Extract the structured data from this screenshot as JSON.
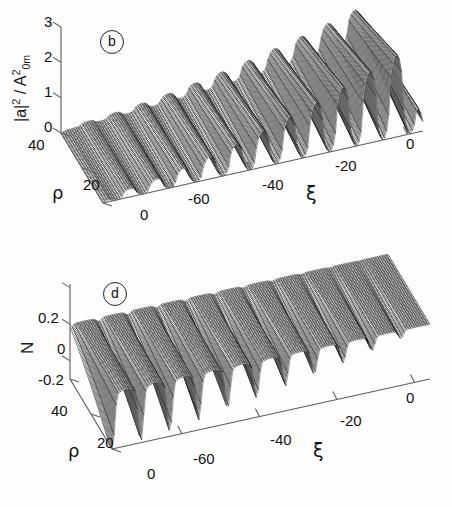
{
  "figure": {
    "background": "#fdfdfd",
    "ink": "#111111",
    "panels": [
      "b",
      "d"
    ]
  },
  "panel_b": {
    "badge": "b",
    "ylabel_main": "|a|",
    "ylabel_sup": "2",
    "ylabel_mid": " / A",
    "ylabel_sup2": "2",
    "ylabel_sub": "0m",
    "ylabel_plain": "|a|2 / A20m",
    "yticks": [
      "3",
      "2",
      "1",
      "0"
    ],
    "xi_label": "ξ",
    "xi_ticks": [
      "-60",
      "-40",
      "-20",
      "0"
    ],
    "rho_label": "ρ",
    "rho_ticks": [
      "40",
      "20",
      "0"
    ]
  },
  "panel_d": {
    "badge": "d",
    "ylabel_plain": "N",
    "yticks": [
      "0.2",
      "0",
      "-0.2"
    ],
    "xi_label": "ξ",
    "xi_ticks": [
      "-60",
      "-40",
      "-20",
      "0"
    ],
    "rho_label": "ρ",
    "rho_ticks": [
      "40",
      "20",
      "0"
    ]
  },
  "chart_data": [
    {
      "type": "surface3d",
      "panel": "b",
      "title": "(b)",
      "zlabel": "|a|^2 / A^2_0m",
      "xlabel": "ξ",
      "ylabel": "ρ",
      "zlim": [
        0,
        3
      ],
      "zticks": [
        0,
        1,
        2,
        3
      ],
      "xlim": [
        -75,
        5
      ],
      "xticks": [
        -60,
        -40,
        -20,
        0
      ],
      "ylim": [
        0,
        40
      ],
      "yticks": [
        0,
        20,
        40
      ],
      "grid": false,
      "legend": "none",
      "description": "Wireframe mesh surface of normalized intensity |a|^2/A^2_0m versus propagation coordinate xi and transverse coordinate rho. A train of roughly 12 periodic crests grows in amplitude from xi = -75 toward xi = 0, reaching peaks near 2.5. Between crests are deep narrow troughs that plunge to near zero at small rho, forming sharp spike-like cusps. Amplitude envelope increases monotonically with xi; modulation is strongest at low rho and smooth near rho = 40.",
      "z_surface_notes": {
        "mean_level": 1.0,
        "peak_max": 2.6,
        "trough_min": 0.0,
        "num_oscillation_periods": 12,
        "envelope_growth": "increasing with xi from -75 to 0"
      },
      "sampled_profile_at_rho0": {
        "xi": [
          -75,
          -70,
          -65,
          -60,
          -55,
          -50,
          -45,
          -40,
          -35,
          -30,
          -25,
          -20,
          -15,
          -10,
          -5,
          0
        ],
        "z": [
          0.25,
          0.4,
          0.15,
          0.9,
          0.05,
          1.2,
          0.05,
          1.5,
          0.05,
          1.8,
          0.05,
          2.1,
          0.05,
          2.4,
          0.1,
          1.0
        ]
      },
      "sampled_profile_at_rho40": {
        "xi": [
          -75,
          -70,
          -65,
          -60,
          -55,
          -50,
          -45,
          -40,
          -35,
          -30,
          -25,
          -20,
          -15,
          -10,
          -5,
          0
        ],
        "z": [
          0.2,
          0.35,
          0.3,
          0.6,
          0.5,
          0.85,
          0.7,
          1.1,
          0.95,
          1.4,
          1.2,
          1.7,
          1.5,
          2.0,
          1.8,
          1.0
        ]
      }
    },
    {
      "type": "surface3d",
      "panel": "d",
      "title": "(d)",
      "zlabel": "N",
      "xlabel": "ξ",
      "ylabel": "ρ",
      "zlim": [
        -0.3,
        0.25
      ],
      "zticks": [
        -0.2,
        0,
        0.2
      ],
      "xlim": [
        -75,
        5
      ],
      "xticks": [
        -60,
        -40,
        -20,
        0
      ],
      "ylim": [
        0,
        40
      ],
      "yticks": [
        0,
        20,
        40
      ],
      "grid": false,
      "legend": "none",
      "description": "Wireframe mesh surface of density perturbation N versus xi and rho. The surface is essentially flat at N = 0 for xi greater than about -20 and is increasingly corrugated toward negative xi, where a series of about 11 sharp V-shaped downward spikes descend well below -0.2. Spike depth grows toward small rho and toward xi near -70; no positive excursions exceed about +0.02.",
      "z_surface_notes": {
        "mean_level": 0.0,
        "peak_max": 0.03,
        "trough_min": -0.32,
        "num_spikes": 11,
        "envelope_growth": "spike depth increases toward negative xi and toward rho = 0"
      },
      "sampled_profile_at_rho0": {
        "xi": [
          -75,
          -70,
          -65,
          -60,
          -55,
          -50,
          -45,
          -40,
          -35,
          -30,
          -25,
          -20,
          -15,
          -10,
          -5,
          0
        ],
        "z": [
          -0.05,
          -0.3,
          -0.02,
          -0.3,
          -0.02,
          -0.28,
          -0.02,
          -0.25,
          -0.02,
          -0.2,
          -0.02,
          -0.14,
          -0.01,
          -0.07,
          -0.01,
          0.0
        ]
      },
      "sampled_profile_at_rho40": {
        "xi": [
          -75,
          -70,
          -65,
          -60,
          -55,
          -50,
          -45,
          -40,
          -35,
          -30,
          -25,
          -20,
          -15,
          -10,
          -5,
          0
        ],
        "z": [
          -0.01,
          -0.05,
          -0.01,
          -0.05,
          -0.01,
          -0.04,
          -0.01,
          -0.035,
          -0.01,
          -0.025,
          0.0,
          -0.015,
          0.0,
          -0.005,
          0.0,
          0.0
        ]
      }
    }
  ]
}
